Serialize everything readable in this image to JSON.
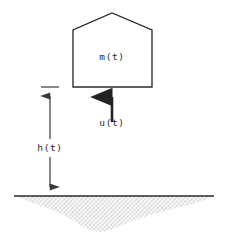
{
  "figure": {
    "background_color": "#ffffff",
    "stroke_color": "#2b2b2b",
    "ground_fill_color": "#c9c9c9",
    "labels": {
      "mass": "m(t)",
      "thrust": "u(t)",
      "altitude": "h(t)"
    },
    "body": {
      "name": "lander-body",
      "apex_x": 112,
      "apex_y": 13,
      "shoulder_y": 30,
      "left_x": 73,
      "right_x": 152,
      "bottom_y": 87
    },
    "thrust_arrow": {
      "name": "thrust-arrow",
      "x": 112,
      "tail_y": 122,
      "head_y": 89,
      "direction": "up"
    },
    "altitude_dimension": {
      "name": "altitude-dimension-line",
      "x": 50,
      "top_y": 87,
      "bottom_y": 196,
      "tick_half_width": 9,
      "arrows": "both"
    },
    "ground": {
      "name": "ground-line",
      "y": 196,
      "x_start": 14,
      "x_end": 214,
      "hatch_depth": 42
    }
  }
}
